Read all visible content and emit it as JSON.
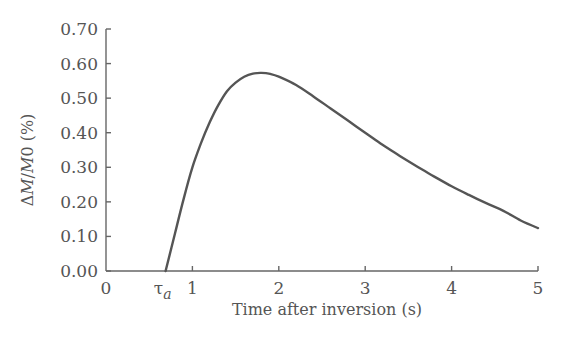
{
  "chart_data": {
    "type": "line",
    "title": "",
    "xlabel": "Time after inversion (s)",
    "ylabel": "ΔM/M0 (%)",
    "xlim": [
      0,
      5
    ],
    "ylim": [
      0,
      0.7
    ],
    "grid": false,
    "legend": null,
    "x_ticks": [
      {
        "value": 0,
        "label": "0"
      },
      {
        "value": 1,
        "label": "1"
      },
      {
        "value": 2,
        "label": "2"
      },
      {
        "value": 3,
        "label": "3"
      },
      {
        "value": 4,
        "label": "4"
      },
      {
        "value": 5,
        "label": "5"
      }
    ],
    "y_ticks": [
      {
        "value": 0.0,
        "label": "0.00"
      },
      {
        "value": 0.1,
        "label": "0.10"
      },
      {
        "value": 0.2,
        "label": "0.20"
      },
      {
        "value": 0.3,
        "label": "0.30"
      },
      {
        "value": 0.4,
        "label": "0.40"
      },
      {
        "value": 0.5,
        "label": "0.50"
      },
      {
        "value": 0.6,
        "label": "0.60"
      },
      {
        "value": 0.7,
        "label": "0.70"
      }
    ],
    "annotations": [
      {
        "text": "τ",
        "subscript": "a",
        "x": 0.69,
        "position": "x-axis",
        "meaning": "arterial transit delay"
      }
    ],
    "series": [
      {
        "name": "ΔM/M0",
        "color": "#555555",
        "x": [
          0.69,
          0.8,
          0.9,
          1.0,
          1.1,
          1.2,
          1.3,
          1.4,
          1.5,
          1.6,
          1.7,
          1.8,
          1.9,
          2.0,
          2.2,
          2.4,
          2.6,
          2.8,
          3.0,
          3.2,
          3.4,
          3.6,
          3.8,
          4.0,
          4.2,
          4.4,
          4.6,
          4.8,
          5.0
        ],
        "values": [
          0.0,
          0.11,
          0.21,
          0.3,
          0.37,
          0.43,
          0.48,
          0.52,
          0.545,
          0.562,
          0.571,
          0.573,
          0.57,
          0.562,
          0.538,
          0.505,
          0.47,
          0.435,
          0.4,
          0.365,
          0.333,
          0.302,
          0.273,
          0.245,
          0.22,
          0.196,
          0.174,
          0.146,
          0.124
        ]
      }
    ]
  },
  "layout": {
    "plot_left": 106,
    "plot_right": 538,
    "plot_top": 29,
    "plot_bottom": 271
  }
}
